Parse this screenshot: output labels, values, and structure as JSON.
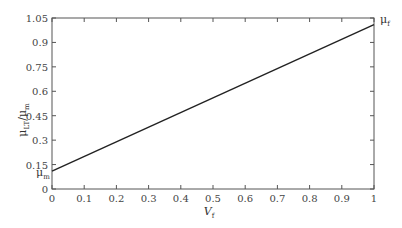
{
  "chart_data": {
    "type": "line",
    "title": "",
    "xlabel": "V_f",
    "ylabel": "μ_LT/μ_m",
    "xlim": [
      0,
      1
    ],
    "ylim": [
      0,
      1.05
    ],
    "x_ticks": [
      "0",
      "0.1",
      "0.2",
      "0.3",
      "0.4",
      "0.5",
      "0.6",
      "0.7",
      "0.8",
      "0.9",
      "1"
    ],
    "y_ticks": [
      "0",
      "0.15",
      "0.3",
      "0.45",
      "0.6",
      "0.75",
      "0.9",
      "1.05"
    ],
    "grid": false,
    "legend": null,
    "annotations": [
      {
        "text": "μ_m",
        "position": "left axis, near y≈0.11"
      },
      {
        "text": "μ_f",
        "position": "right axis, near y≈1.01"
      }
    ],
    "series": [
      {
        "name": "μ_LT/μ_m",
        "x": [
          0,
          1
        ],
        "values": [
          0.11,
          1.01
        ],
        "color": "#222222"
      }
    ]
  },
  "labels": {
    "xlabel_main": "V",
    "xlabel_sub": "f",
    "ylabel_main": "μ",
    "ylabel_sub1": "LT",
    "ylabel_mid": "/μ",
    "ylabel_sub2": "m",
    "mu_m_main": "μ",
    "mu_m_sub": "m",
    "mu_f_main": "μ",
    "mu_f_sub": "f"
  }
}
